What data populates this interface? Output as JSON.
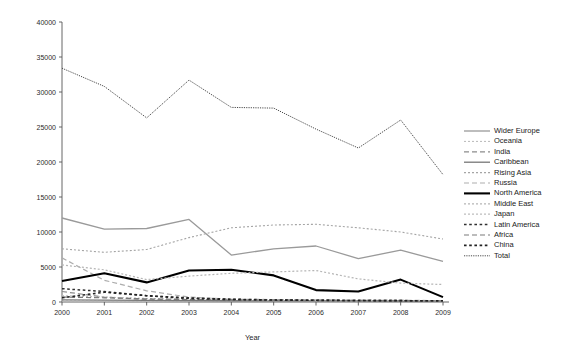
{
  "chart_data": {
    "type": "line",
    "title": "",
    "subtitle": "",
    "xlabel": "Year",
    "ylabel": "",
    "categories": [
      "2000",
      "2001",
      "2002",
      "2003",
      "2004",
      "2005",
      "2006",
      "2007",
      "2008",
      "2009"
    ],
    "x": [
      2000,
      2001,
      2002,
      2003,
      2004,
      2005,
      2006,
      2007,
      2008,
      2009
    ],
    "xlim": [
      2000,
      2009
    ],
    "ylim": [
      0,
      40000
    ],
    "y_ticks": [
      0,
      5000,
      10000,
      15000,
      20000,
      25000,
      30000,
      35000,
      40000
    ],
    "y_tick_labels": [
      "0",
      "5000",
      "10000",
      "15000",
      "20000",
      "25000",
      "30000",
      "35000",
      "40000"
    ],
    "grid": false,
    "legend_position": "right",
    "series": [
      {
        "name": "Wider Europe",
        "style": "solid",
        "color": "#9a9a9a",
        "width": 1.3,
        "values": [
          12000,
          10400,
          10500,
          11800,
          6700,
          7600,
          8000,
          6200,
          7400,
          5800
        ]
      },
      {
        "name": "Oceania",
        "style": "dotted",
        "color": "#b8b8b8",
        "width": 1.0,
        "values": [
          120,
          100,
          90,
          80,
          70,
          70,
          60,
          60,
          60,
          50
        ]
      },
      {
        "name": "India",
        "style": "dashed",
        "color": "#8c8c8c",
        "width": 1.2,
        "values": [
          1500,
          700,
          350,
          300,
          250,
          200,
          200,
          180,
          160,
          150
        ]
      },
      {
        "name": "Caribbean",
        "style": "solid",
        "color": "#777777",
        "width": 1.3,
        "values": [
          300,
          260,
          220,
          200,
          180,
          170,
          160,
          150,
          140,
          130
        ]
      },
      {
        "name": "Rising Asia",
        "style": "dotted",
        "color": "#a5a5a5",
        "width": 1.1,
        "values": [
          7600,
          7100,
          7500,
          9200,
          10600,
          11000,
          11100,
          10600,
          10000,
          9000
        ]
      },
      {
        "name": "Russia",
        "style": "dashed",
        "color": "#adadad",
        "width": 1.2,
        "values": [
          6300,
          3100,
          1600,
          700,
          400,
          350,
          300,
          260,
          240,
          200
        ]
      },
      {
        "name": "North America",
        "style": "solid",
        "color": "#000000",
        "width": 2.1,
        "values": [
          3000,
          4100,
          2800,
          4500,
          4600,
          3800,
          1700,
          1500,
          3200,
          700
        ]
      },
      {
        "name": "Middle East",
        "style": "dotted",
        "color": "#b5b5b5",
        "width": 1.2,
        "values": [
          5300,
          4600,
          3200,
          3700,
          4100,
          4300,
          4500,
          3300,
          2700,
          2500
        ]
      },
      {
        "name": "Japan",
        "style": "dotted",
        "color": "#bdbdbd",
        "width": 1.2,
        "values": [
          900,
          700,
          500,
          400,
          350,
          300,
          260,
          240,
          220,
          200
        ]
      },
      {
        "name": "Latin America",
        "style": "dotted-coarse",
        "color": "#303030",
        "width": 1.5,
        "values": [
          1900,
          1500,
          900,
          600,
          400,
          300,
          250,
          220,
          200,
          180
        ]
      },
      {
        "name": "Africa",
        "style": "dashed",
        "color": "#7a7a7a",
        "width": 1.2,
        "values": [
          700,
          600,
          450,
          350,
          300,
          260,
          230,
          210,
          190,
          170
        ]
      },
      {
        "name": "China",
        "style": "dotted-coarse",
        "color": "#222222",
        "width": 1.6,
        "values": [
          600,
          1400,
          900,
          500,
          350,
          280,
          240,
          210,
          190,
          170
        ]
      },
      {
        "name": "Total",
        "style": "fine-dotted",
        "color": "#4a4a4a",
        "width": 1.0,
        "values": [
          33400,
          30800,
          26300,
          31700,
          27800,
          27700,
          24700,
          22000,
          26000,
          18200
        ]
      }
    ]
  },
  "legend": {
    "items": [
      {
        "label": "Wider Europe"
      },
      {
        "label": "Oceania"
      },
      {
        "label": "India"
      },
      {
        "label": "Caribbean"
      },
      {
        "label": "Rising Asia"
      },
      {
        "label": "Russia"
      },
      {
        "label": "North America"
      },
      {
        "label": "Middle East"
      },
      {
        "label": "Japan"
      },
      {
        "label": "Latin America"
      },
      {
        "label": "Africa"
      },
      {
        "label": "China"
      },
      {
        "label": "Total"
      }
    ]
  }
}
